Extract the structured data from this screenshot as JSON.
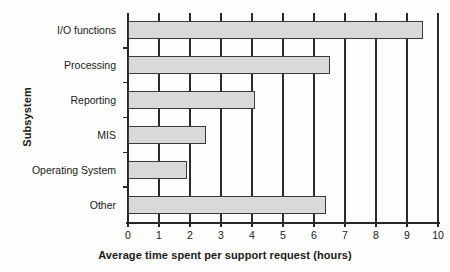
{
  "chart_data": {
    "type": "bar",
    "orientation": "horizontal",
    "title": "",
    "xlabel": "Average time spent per support request (hours)",
    "ylabel": "Subsystem",
    "categories": [
      "I/O functions",
      "Processing",
      "Reporting",
      "MIS",
      "Operating System",
      "Other"
    ],
    "values": [
      9.5,
      6.5,
      4.1,
      2.5,
      1.9,
      6.4
    ],
    "series": [
      {
        "name": "Average time spent per support request (hours)",
        "values": [
          9.5,
          6.5,
          4.1,
          2.5,
          1.9,
          6.4
        ]
      }
    ],
    "xlim": [
      0,
      10
    ],
    "xticks": [
      0,
      1,
      2,
      3,
      4,
      5,
      6,
      7,
      8,
      9,
      10
    ],
    "xtick_labels": [
      "0",
      "1",
      "2",
      "3",
      "4",
      "5",
      "6",
      "7",
      "8",
      "9",
      "10"
    ],
    "grid": "vertical",
    "legend": "none",
    "bar_fill_color": "#d9d9d9",
    "bar_edge_color": "#3a3a3a",
    "axis_color": "#262626",
    "background_color": "#fdfdfb"
  }
}
